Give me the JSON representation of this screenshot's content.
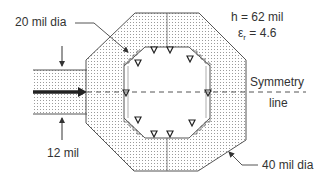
{
  "diagram": {
    "labels": {
      "inner_dia": "20 mil dia",
      "outer_dia": "40 mil dia",
      "h": "h = 62 mil",
      "eps_symbol": "ε",
      "eps_sub": "r",
      "eps_value": " = 4.6",
      "symmetry_1": "Symmetry",
      "symmetry_2": "line",
      "width": "12 mil"
    },
    "colors": {
      "stroke": "#555555",
      "dots": "#8a8a8a",
      "fill": "#ffffff",
      "arrow": "#333333"
    },
    "parameters": {
      "substrate_height_mil": 62,
      "relative_permittivity": 4.6,
      "inner_diameter_mil": 20,
      "outer_diameter_mil": 40,
      "feedline_width_mil": 12
    }
  }
}
